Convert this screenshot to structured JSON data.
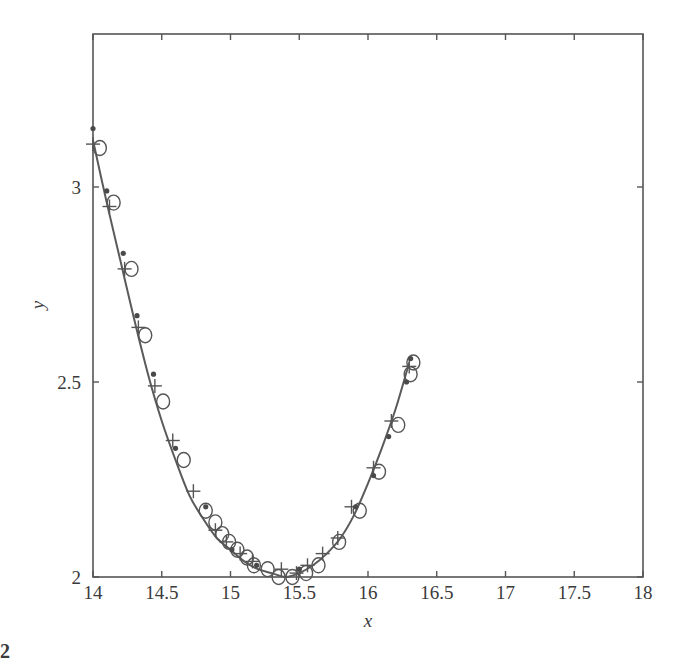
{
  "figure": {
    "corner_label_fragment": "2"
  },
  "chart_data": {
    "type": "scatter",
    "title": "",
    "xlabel": "x",
    "ylabel": "y",
    "xlim": [
      14,
      18
    ],
    "ylim": [
      2,
      3.4
    ],
    "grid": false,
    "legend": null,
    "x_ticks": [
      14,
      14.5,
      15,
      15.5,
      16,
      16.5,
      17,
      17.5,
      18
    ],
    "x_tick_labels": [
      "14",
      "14.5",
      "15",
      "15.5",
      "16",
      "16.5",
      "17",
      "17.5",
      "18"
    ],
    "y_ticks": [
      2,
      2.5,
      3
    ],
    "y_tick_labels": [
      "2",
      "2.5",
      "3"
    ],
    "series": [
      {
        "name": "fit-curve",
        "kind": "line",
        "x": [
          14.0,
          14.1,
          14.2,
          14.3,
          14.4,
          14.5,
          14.6,
          14.7,
          14.8,
          14.9,
          15.0,
          15.1,
          15.2,
          15.3,
          15.4,
          15.5,
          15.6,
          15.7,
          15.8,
          15.9,
          16.0,
          16.1,
          16.2,
          16.3
        ],
        "y": [
          3.12,
          2.96,
          2.81,
          2.66,
          2.52,
          2.4,
          2.3,
          2.21,
          2.15,
          2.1,
          2.07,
          2.04,
          2.02,
          2.01,
          2.0,
          2.01,
          2.03,
          2.06,
          2.1,
          2.16,
          2.24,
          2.33,
          2.43,
          2.55
        ]
      },
      {
        "name": "circles",
        "kind": "marker",
        "marker": "circle",
        "x": [
          14.05,
          14.15,
          14.28,
          14.38,
          14.51,
          14.66,
          14.82,
          14.89,
          14.94,
          14.99,
          15.05,
          15.12,
          15.17,
          15.27,
          15.35,
          15.45,
          15.55,
          15.64,
          15.79,
          15.94,
          16.08,
          16.22,
          16.31,
          16.33
        ],
        "y": [
          3.1,
          2.96,
          2.79,
          2.62,
          2.45,
          2.3,
          2.17,
          2.14,
          2.11,
          2.09,
          2.07,
          2.05,
          2.03,
          2.02,
          2.0,
          2.0,
          2.01,
          2.03,
          2.09,
          2.17,
          2.27,
          2.39,
          2.52,
          2.55
        ]
      },
      {
        "name": "plus",
        "kind": "marker",
        "marker": "plus",
        "x": [
          14.0,
          14.12,
          14.23,
          14.33,
          14.45,
          14.58,
          14.73,
          14.89,
          14.97,
          15.07,
          15.16,
          15.37,
          15.48,
          15.56,
          15.67,
          15.78,
          15.88,
          16.04,
          16.17,
          16.3
        ],
        "y": [
          3.11,
          2.95,
          2.79,
          2.64,
          2.49,
          2.35,
          2.22,
          2.12,
          2.09,
          2.06,
          2.04,
          2.02,
          2.01,
          2.03,
          2.06,
          2.1,
          2.18,
          2.28,
          2.4,
          2.54
        ]
      },
      {
        "name": "dots",
        "kind": "marker",
        "marker": "dot",
        "x": [
          14.0,
          14.1,
          14.22,
          14.32,
          14.44,
          14.6,
          14.82,
          15.01,
          15.19,
          15.5,
          15.91,
          16.04,
          16.15,
          16.28,
          16.31
        ],
        "y": [
          3.15,
          2.99,
          2.83,
          2.67,
          2.52,
          2.33,
          2.18,
          2.07,
          2.03,
          2.02,
          2.18,
          2.26,
          2.36,
          2.5,
          2.56
        ]
      }
    ],
    "colors": {
      "frame": "#555555",
      "line": "#5a5a5a",
      "markers": "#555555",
      "text": "#3a3a3a",
      "background": "#ffffff"
    }
  }
}
